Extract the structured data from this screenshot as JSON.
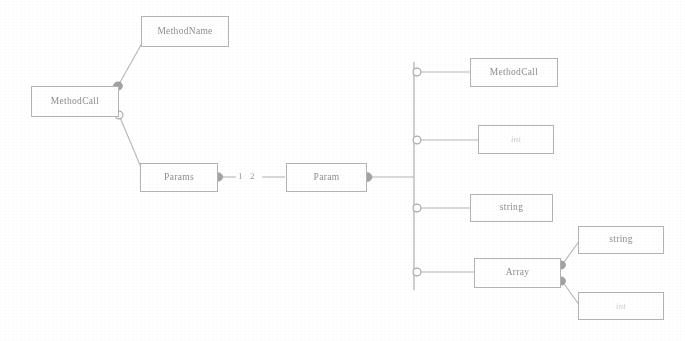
{
  "diagram": {
    "type": "uml-class-diagram",
    "background_color": "#ffffff",
    "line_color": "#b0b0b0",
    "text_color": "#8e8e8e",
    "faint_text_color": "#c9c9c9"
  },
  "nodes": {
    "method_call_left": {
      "label": "MethodCall"
    },
    "method_name": {
      "label": "MethodName"
    },
    "params": {
      "label": "Params"
    },
    "param": {
      "label": "Param"
    },
    "method_call_right": {
      "label": "MethodCall"
    },
    "int_top": {
      "label": "int"
    },
    "string_mid": {
      "label": "string"
    },
    "array": {
      "label": "Array"
    },
    "string_right": {
      "label": "string"
    },
    "int_bottom": {
      "label": "int"
    }
  },
  "edge_labels": {
    "multiplicity_one": "1",
    "multiplicity_two": "2"
  },
  "connectors": {
    "filled_diamond": "filled-diamond-marker",
    "hollow_circle": "hollow-circle-marker",
    "generalization_bar": "vertical-generalization-bar"
  }
}
